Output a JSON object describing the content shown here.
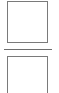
{
  "layout": {
    "elements": [
      {
        "type": "box",
        "name": "top-box",
        "label": ""
      },
      {
        "type": "divider",
        "name": "fraction-divider"
      },
      {
        "type": "box",
        "name": "bottom-box",
        "label": ""
      }
    ]
  },
  "colors": {
    "stroke": "#7a7a7a",
    "divider": "#6e6e6e",
    "background": "#ffffff"
  },
  "top_box": {
    "text": ""
  },
  "bottom_box": {
    "text": ""
  }
}
